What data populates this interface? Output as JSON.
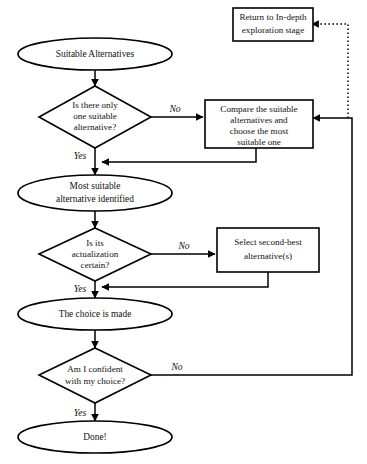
{
  "diagram": {
    "type": "flowchart",
    "colors": {
      "background": "#ffffff",
      "stroke": "#000000",
      "text": "#111111"
    },
    "nodes": {
      "start": {
        "shape": "ellipse",
        "label": "Suitable Alternatives"
      },
      "decision_one": {
        "shape": "diamond",
        "line1": "Is there only",
        "line2": "one suitable",
        "line3": "alternative?"
      },
      "compare_box": {
        "shape": "rectangle",
        "line1": "Compare the suitable",
        "line2": "alternatives and",
        "line3": "choose the most",
        "line4": "suitable one"
      },
      "return_box": {
        "shape": "rectangle",
        "line1": "Return to In-depth",
        "line2": "exploration stage"
      },
      "most_suitable": {
        "shape": "ellipse",
        "line1": "Most suitable",
        "line2": "alternative identified"
      },
      "decision_actualization": {
        "shape": "diamond",
        "line1": "Is its",
        "line2": "actualization",
        "line3": "certain?"
      },
      "second_best_box": {
        "shape": "rectangle",
        "line1": "Select second-best",
        "line2": "alternative(s)"
      },
      "choice_made": {
        "shape": "ellipse",
        "label": "The choice is made"
      },
      "decision_confident": {
        "shape": "diamond",
        "line1": "Am I confident",
        "line2": "with my choice?"
      },
      "done": {
        "shape": "ellipse",
        "label": "Done!"
      }
    },
    "edge_labels": {
      "no_one": "No",
      "yes_one": "Yes",
      "no_actualization": "No",
      "yes_actualization": "Yes",
      "no_confident": "No",
      "yes_confident": "Yes"
    }
  }
}
